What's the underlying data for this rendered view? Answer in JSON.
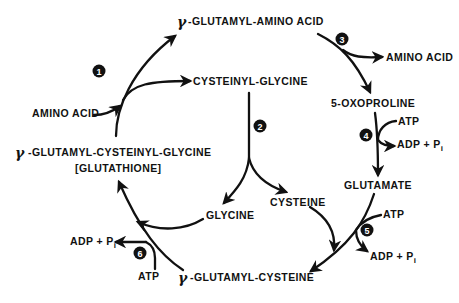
{
  "diagram": {
    "gamma_symbol": "γ",
    "nodes": {
      "gamma_glutamyl_amino_acid": "-GLUTAMYL-AMINO ACID",
      "cysteinyl_glycine": "CYSTEINYL-GLYCINE",
      "amino_acid_in": "AMINO ACID",
      "amino_acid_out": "AMINO ACID",
      "oxoproline": "5-OXOPROLINE",
      "glutamate": "GLUTAMATE",
      "cysteine": "CYSTEINE",
      "glycine": "GLYCINE",
      "gamma_glutamyl_cysteine": "-GLUTAMYL-CYSTEINE",
      "glutathione_full": "-GLUTAMYL-CYSTEINYL-GLYCINE",
      "glutathione_name": "[GLUTATHIONE]"
    },
    "cofactors": {
      "step4_atp": "ATP",
      "step4_adp": "ADP + P",
      "step4_adp_sub": "i",
      "step5_atp": "ATP",
      "step5_adp": "ADP + P",
      "step5_adp_sub": "i",
      "step6_atp": "ATP",
      "step6_adp": "ADP + P",
      "step6_adp_sub": "i"
    },
    "steps": [
      {
        "number": "1",
        "from": "AMINO ACID + GLUTATHIONE",
        "to": "γ-GLUTAMYL-AMINO ACID + CYSTEINYL-GLYCINE"
      },
      {
        "number": "2",
        "from": "CYSTEINYL-GLYCINE",
        "to": "GLYCINE + CYSTEINE"
      },
      {
        "number": "3",
        "from": "γ-GLUTAMYL-AMINO ACID",
        "to": "5-OXOPROLINE + AMINO ACID"
      },
      {
        "number": "4",
        "from": "5-OXOPROLINE + ATP",
        "to": "GLUTAMATE + ADP + Pi"
      },
      {
        "number": "5",
        "from": "GLUTAMATE + CYSTEINE + ATP",
        "to": "γ-GLUTAMYL-CYSTEINE + ADP + Pi"
      },
      {
        "number": "6",
        "from": "γ-GLUTAMYL-CYSTEINE + GLYCINE + ATP",
        "to": "GLUTATHIONE + ADP + Pi"
      }
    ],
    "colors": {
      "ink": "#111111",
      "background": "#ffffff"
    }
  }
}
